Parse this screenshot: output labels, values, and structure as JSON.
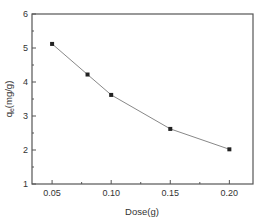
{
  "chart_data": {
    "type": "line",
    "title": "",
    "xlabel": "Dose(g)",
    "ylabel": "q_e(mg/g)",
    "ylabel_main": "q",
    "ylabel_sub": "e",
    "ylabel_rest": "(mg/g)",
    "xlim": [
      0.033,
      0.22
    ],
    "ylim": [
      1,
      6
    ],
    "x_ticks": [
      "0.05",
      "0.10",
      "0.15",
      "0.20"
    ],
    "y_ticks": [
      "1",
      "2",
      "3",
      "4",
      "5",
      "6"
    ],
    "grid": false,
    "legend": null,
    "series": [
      {
        "name": "qe",
        "x": [
          0.05,
          0.08,
          0.1,
          0.15,
          0.2
        ],
        "values": [
          5.12,
          4.22,
          3.62,
          2.62,
          2.02
        ],
        "marker": "square",
        "color": "#888888"
      }
    ]
  }
}
